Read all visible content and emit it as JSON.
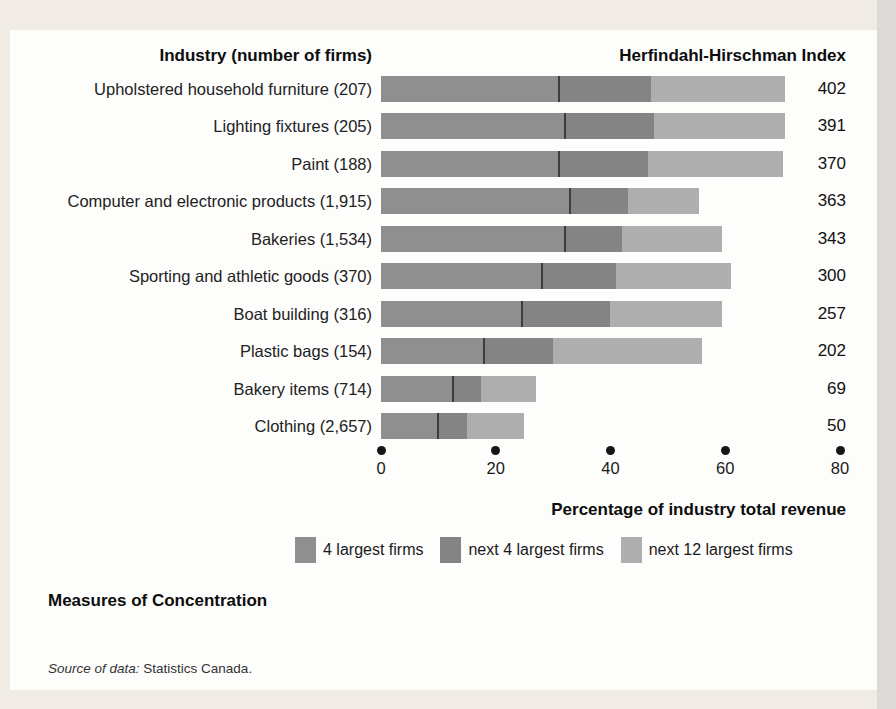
{
  "page": {
    "figure_title": "Measures of Concentration",
    "source_prefix": "Source of data:",
    "source_text": "Statistics Canada."
  },
  "chart_data": {
    "type": "bar",
    "orientation": "horizontal",
    "stacked": true,
    "left_header": "Industry (number of firms)",
    "right_header": "Herfindahl-Hirschman Index",
    "xlabel": "Percentage of industry total revenue",
    "x_ticks": [
      0,
      20,
      40,
      60,
      80
    ],
    "xlim": [
      0,
      80
    ],
    "grid": false,
    "legend_position": "bottom",
    "series_names": [
      "4 largest firms",
      "next 4 largest firms",
      "next 12 largest firms"
    ],
    "series_colors": [
      "#8f8f8f",
      "#848484",
      "#aeaeae"
    ],
    "divider_color": "#3d3d3d",
    "rows": [
      {
        "industry": "Upholstered household furniture",
        "firms": "(207)",
        "hhi": "402",
        "segments": [
          31,
          16,
          23.5
        ]
      },
      {
        "industry": "Lighting fixtures",
        "firms": "(205)",
        "hhi": "391",
        "segments": [
          32,
          15.5,
          23
        ]
      },
      {
        "industry": "Paint",
        "firms": "(188)",
        "hhi": "370",
        "segments": [
          31,
          15.5,
          23.5
        ]
      },
      {
        "industry": "Computer and electronic products",
        "firms": "(1,915)",
        "hhi": "363",
        "segments": [
          33,
          10,
          12.5
        ]
      },
      {
        "industry": "Bakeries",
        "firms": "(1,534)",
        "hhi": "343",
        "segments": [
          32,
          10,
          17.5
        ]
      },
      {
        "industry": "Sporting and athletic goods",
        "firms": "(370)",
        "hhi": "300",
        "segments": [
          28,
          13,
          20
        ]
      },
      {
        "industry": "Boat building",
        "firms": "(316)",
        "hhi": "257",
        "segments": [
          24.5,
          15.5,
          19.5
        ]
      },
      {
        "industry": "Plastic bags",
        "firms": "(154)",
        "hhi": "202",
        "segments": [
          18,
          12,
          26
        ]
      },
      {
        "industry": "Bakery items",
        "firms": "(714)",
        "hhi": "69",
        "segments": [
          12.5,
          5,
          9.5
        ]
      },
      {
        "industry": "Clothing",
        "firms": "(2,657)",
        "hhi": "50",
        "segments": [
          10,
          5,
          10
        ]
      }
    ]
  }
}
